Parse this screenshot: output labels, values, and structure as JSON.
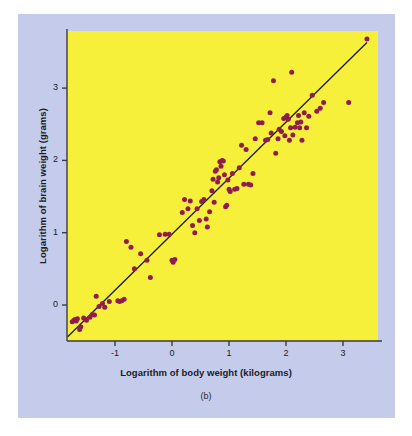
{
  "figure": {
    "caption": "(b)",
    "panel_color": "#c5cceb",
    "plot_background": "#f7f03a",
    "point_color": "#8f1d4b",
    "line_color": "#1a1a20",
    "axis_color": "#3a3a44"
  },
  "chart_data": {
    "type": "scatter",
    "title": "",
    "xlabel": "Logarithm of body weight (kilograms)",
    "ylabel": "Logarithm of brain weight (grams)",
    "xlim": [
      -1.85,
      3.6
    ],
    "ylim": [
      -0.5,
      3.75
    ],
    "xticks": [
      -1,
      0,
      1,
      2,
      3
    ],
    "xticklabels": [
      "-1",
      "0",
      "1",
      "2",
      "3"
    ],
    "yticks": [
      0,
      1,
      2,
      3
    ],
    "yticklabels": [
      "0",
      "1",
      "2",
      "3"
    ],
    "grid": false,
    "legend": false,
    "trendline": {
      "type": "linear",
      "x_start": -1.83,
      "y_start": -0.44,
      "x_end": 3.42,
      "y_end": 3.63
    },
    "points": [
      [
        -1.75,
        -0.23
      ],
      [
        -1.72,
        -0.21
      ],
      [
        -1.7,
        -0.2
      ],
      [
        -1.68,
        -0.22
      ],
      [
        -1.66,
        -0.19
      ],
      [
        -1.62,
        -0.34
      ],
      [
        -1.6,
        -0.3
      ],
      [
        -1.55,
        -0.18
      ],
      [
        -1.5,
        -0.21
      ],
      [
        -1.44,
        -0.17
      ],
      [
        -1.4,
        -0.13
      ],
      [
        -1.36,
        -0.14
      ],
      [
        -1.33,
        0.12
      ],
      [
        -1.28,
        -0.02
      ],
      [
        -1.22,
        0.02
      ],
      [
        -1.18,
        -0.03
      ],
      [
        -1.1,
        0.05
      ],
      [
        -0.95,
        0.06
      ],
      [
        -0.92,
        0.05
      ],
      [
        -0.88,
        0.06
      ],
      [
        -0.84,
        0.08
      ],
      [
        -0.8,
        0.88
      ],
      [
        -0.72,
        0.8
      ],
      [
        -0.66,
        0.5
      ],
      [
        -0.55,
        0.71
      ],
      [
        -0.44,
        0.62
      ],
      [
        -0.38,
        0.38
      ],
      [
        -0.22,
        0.97
      ],
      [
        -0.12,
        0.98
      ],
      [
        -0.05,
        0.98
      ],
      [
        0.0,
        0.62
      ],
      [
        0.02,
        0.59
      ],
      [
        0.05,
        0.63
      ],
      [
        0.18,
        1.28
      ],
      [
        0.22,
        1.46
      ],
      [
        0.28,
        1.33
      ],
      [
        0.32,
        1.44
      ],
      [
        0.36,
        1.1
      ],
      [
        0.4,
        1.0
      ],
      [
        0.44,
        1.33
      ],
      [
        0.48,
        1.17
      ],
      [
        0.52,
        1.43
      ],
      [
        0.56,
        1.46
      ],
      [
        0.6,
        1.19
      ],
      [
        0.62,
        1.08
      ],
      [
        0.66,
        1.29
      ],
      [
        0.7,
        1.58
      ],
      [
        0.72,
        1.74
      ],
      [
        0.74,
        1.42
      ],
      [
        0.76,
        1.85
      ],
      [
        0.78,
        1.87
      ],
      [
        0.8,
        1.7
      ],
      [
        0.82,
        1.76
      ],
      [
        0.84,
        1.98
      ],
      [
        0.86,
        1.92
      ],
      [
        0.88,
        2.0
      ],
      [
        0.9,
        1.99
      ],
      [
        0.92,
        1.8
      ],
      [
        0.94,
        1.36
      ],
      [
        0.96,
        1.38
      ],
      [
        0.98,
        1.73
      ],
      [
        1.0,
        1.6
      ],
      [
        1.02,
        1.57
      ],
      [
        1.06,
        1.82
      ],
      [
        1.1,
        1.6
      ],
      [
        1.14,
        1.61
      ],
      [
        1.18,
        1.9
      ],
      [
        1.22,
        2.21
      ],
      [
        1.26,
        1.67
      ],
      [
        1.3,
        2.15
      ],
      [
        1.34,
        1.67
      ],
      [
        1.38,
        1.66
      ],
      [
        1.42,
        1.82
      ],
      [
        1.46,
        2.3
      ],
      [
        1.52,
        2.52
      ],
      [
        1.58,
        2.52
      ],
      [
        1.64,
        2.28
      ],
      [
        1.68,
        2.29
      ],
      [
        1.72,
        2.66
      ],
      [
        1.74,
        2.38
      ],
      [
        1.78,
        3.1
      ],
      [
        1.82,
        2.1
      ],
      [
        1.86,
        2.3
      ],
      [
        1.88,
        2.43
      ],
      [
        1.92,
        2.4
      ],
      [
        1.96,
        2.58
      ],
      [
        1.98,
        2.34
      ],
      [
        2.0,
        2.6
      ],
      [
        2.02,
        2.62
      ],
      [
        2.04,
        2.57
      ],
      [
        2.06,
        2.28
      ],
      [
        2.08,
        2.45
      ],
      [
        2.1,
        3.22
      ],
      [
        2.12,
        2.35
      ],
      [
        2.16,
        2.46
      ],
      [
        2.2,
        2.52
      ],
      [
        2.22,
        2.62
      ],
      [
        2.24,
        2.45
      ],
      [
        2.26,
        2.53
      ],
      [
        2.28,
        2.28
      ],
      [
        2.32,
        2.66
      ],
      [
        2.36,
        2.45
      ],
      [
        2.4,
        2.61
      ],
      [
        2.46,
        2.9
      ],
      [
        2.54,
        2.68
      ],
      [
        2.6,
        2.72
      ],
      [
        2.66,
        2.8
      ],
      [
        3.1,
        2.8
      ],
      [
        3.42,
        3.68
      ]
    ]
  }
}
